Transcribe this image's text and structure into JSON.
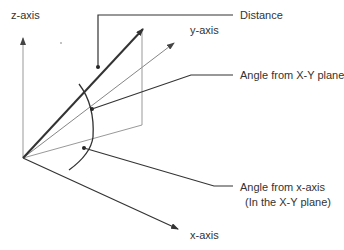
{
  "diagram": {
    "axes": {
      "z": {
        "label": "z-axis"
      },
      "y": {
        "label": "y-axis"
      },
      "x": {
        "label": "x-axis"
      }
    },
    "callouts": {
      "distance": {
        "label": "Distance"
      },
      "angle_xy_plane": {
        "label": "Angle from X-Y plane"
      },
      "angle_x_axis": {
        "label": "Angle from x-axis",
        "sublabel": "(In the X-Y plane)"
      }
    },
    "colors": {
      "thick_line": "#333333",
      "thin_line": "#999999",
      "text": "#333333"
    }
  }
}
